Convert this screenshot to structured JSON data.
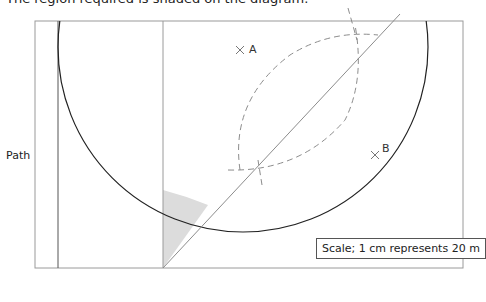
{
  "caption": "The region required is shaded on the diagram.",
  "labels": {
    "path": "Path",
    "point_a": "A",
    "point_b": "B"
  },
  "scale": "Scale; 1 cm represents 20 m",
  "colors": {
    "frame": "#9a9a9a",
    "circle": "#222222",
    "bisector": "#8c8c8c",
    "construction_arcs": "#8c8c8c",
    "shaded_region": "#dcdcdc",
    "path_edge_dark": "#333333"
  },
  "icons": {
    "point_marker": "cross-mark-icon"
  }
}
